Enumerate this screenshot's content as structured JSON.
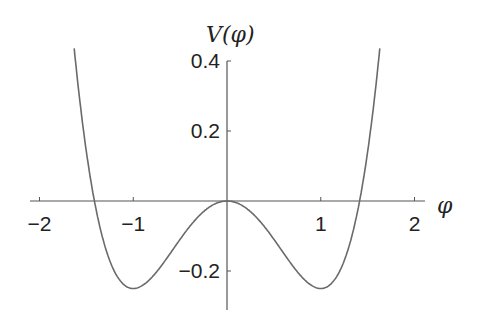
{
  "chart_data": {
    "type": "line",
    "title": "",
    "xlabel": "φ",
    "ylabel": "V(φ)",
    "function": "V(φ) = φ^4/4 − φ^2/2",
    "xlim": [
      -2.1,
      2.1
    ],
    "ylim": [
      -0.31,
      0.4
    ],
    "x_ticks": [
      -2,
      -1,
      1,
      2
    ],
    "x_tick_labels": [
      "−2",
      "−1",
      "1",
      "2"
    ],
    "y_ticks": [
      -0.2,
      0.2,
      0.4
    ],
    "y_tick_labels": [
      "−0.2",
      "0.2",
      "0.4"
    ],
    "grid": false,
    "series": [
      {
        "name": "V(φ)",
        "x": [
          -1.63,
          -1.5,
          -1.414,
          -1.25,
          -1.0,
          -0.75,
          -0.5,
          -0.25,
          0,
          0.25,
          0.5,
          0.75,
          1.0,
          1.25,
          1.414,
          1.5,
          1.63
        ],
        "values": [
          0.434,
          0.141,
          0.0,
          -0.171,
          -0.25,
          -0.202,
          -0.109,
          -0.03,
          0.0,
          -0.03,
          -0.109,
          -0.202,
          -0.25,
          -0.171,
          0.0,
          0.141,
          0.434
        ]
      }
    ],
    "annotations": {
      "minima": [
        [
          -1,
          -0.25
        ],
        [
          1,
          -0.25
        ]
      ],
      "local_max": [
        0,
        0
      ],
      "zeros": [
        -1.414,
        0,
        1.414
      ]
    },
    "color": "#6a6a6a"
  },
  "layout": {
    "origin_px": [
      227,
      201
    ],
    "x_scale_px": 93.75,
    "y_scale_px": 350,
    "x_axis_px": [
      30,
      425
    ],
    "y_axis_px": [
      61,
      310
    ]
  }
}
